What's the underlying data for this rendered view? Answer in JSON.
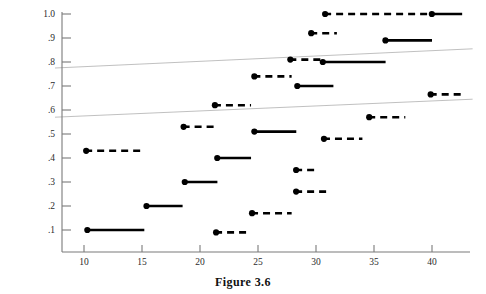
{
  "figure": {
    "caption": "Figure 3.6"
  },
  "chart_data": {
    "type": "line",
    "title": "",
    "xlabel": "",
    "ylabel": "",
    "xlim": [
      7.5,
      43.5
    ],
    "ylim": [
      0.02,
      1.04
    ],
    "grid": false,
    "legend": null,
    "x_ticks": [
      10,
      15,
      20,
      25,
      30,
      35,
      40
    ],
    "x_tick_labels": [
      "10",
      "15",
      "20",
      "25",
      "30",
      "35",
      "40"
    ],
    "y_ticks": [
      0.1,
      0.2,
      0.3,
      0.4,
      0.5,
      0.6,
      0.7,
      0.8,
      0.9,
      1.0
    ],
    "y_tick_labels": [
      ".1",
      ".2",
      ".3",
      ".4",
      ".5",
      ".6",
      ".7",
      ".8",
      ".9",
      "1.0"
    ],
    "axis_color": "#7a7a7a",
    "segment_color": "#000000",
    "trend_color": "#b9b9b9",
    "segments": [
      {
        "y": 0.1,
        "x0": 10.2,
        "x1": 15.2,
        "style": "solid",
        "marker": "left-dot"
      },
      {
        "y": 0.2,
        "x0": 15.3,
        "x1": 18.5,
        "style": "solid",
        "marker": "left-dot"
      },
      {
        "y": 0.3,
        "x0": 18.6,
        "x1": 21.5,
        "style": "solid",
        "marker": "left-dot"
      },
      {
        "y": 0.4,
        "x0": 21.4,
        "x1": 24.4,
        "style": "solid",
        "marker": "left-dot"
      },
      {
        "y": 0.51,
        "x0": 24.6,
        "x1": 28.3,
        "style": "solid",
        "marker": "left-dot"
      },
      {
        "y": 0.7,
        "x0": 28.3,
        "x1": 31.5,
        "style": "solid",
        "marker": "left-dot"
      },
      {
        "y": 0.8,
        "x0": 30.5,
        "x1": 36.0,
        "style": "solid",
        "marker": "left-dot"
      },
      {
        "y": 0.89,
        "x0": 35.9,
        "x1": 40.0,
        "style": "solid",
        "marker": "left-dot"
      },
      {
        "y": 1.0,
        "x0": 39.9,
        "x1": 42.6,
        "style": "solid",
        "marker": "left-dot"
      },
      {
        "y": 0.43,
        "x0": 10.1,
        "x1": 15.1,
        "style": "dashed",
        "marker": "left-dot"
      },
      {
        "y": 0.53,
        "x0": 18.5,
        "x1": 21.6,
        "style": "dashed",
        "marker": "left-dot"
      },
      {
        "y": 0.62,
        "x0": 21.2,
        "x1": 24.4,
        "style": "dashed",
        "marker": "left-dot"
      },
      {
        "y": 0.74,
        "x0": 24.6,
        "x1": 27.9,
        "style": "dashed",
        "marker": "left-dot"
      },
      {
        "y": 0.81,
        "x0": 27.7,
        "x1": 30.4,
        "style": "dashed",
        "marker": "left-dot"
      },
      {
        "y": 0.92,
        "x0": 29.5,
        "x1": 31.8,
        "style": "dashed",
        "marker": "left-dot"
      },
      {
        "y": 1.0,
        "x0": 30.7,
        "x1": 40.0,
        "style": "dashed",
        "marker": "left-dot"
      },
      {
        "y": 0.09,
        "x0": 21.3,
        "x1": 24.4,
        "style": "dashed",
        "marker": "left-dot"
      },
      {
        "y": 0.17,
        "x0": 24.4,
        "x1": 27.9,
        "style": "dashed",
        "marker": "left-dot"
      },
      {
        "y": 0.26,
        "x0": 28.2,
        "x1": 31.0,
        "style": "dashed",
        "marker": "left-dot"
      },
      {
        "y": 0.35,
        "x0": 28.2,
        "x1": 30.0,
        "style": "dashed",
        "marker": "left-dot"
      },
      {
        "y": 0.48,
        "x0": 30.6,
        "x1": 34.0,
        "style": "dashed",
        "marker": "left-dot"
      },
      {
        "y": 0.57,
        "x0": 34.5,
        "x1": 37.7,
        "style": "dashed",
        "marker": "left-dot"
      },
      {
        "y": 0.665,
        "x0": 39.8,
        "x1": 42.8,
        "style": "dashed",
        "marker": "left-dot"
      }
    ],
    "trend_lines": [
      {
        "name": "upper-band",
        "x0": 7.5,
        "y0": 0.775,
        "x1": 43.5,
        "y1": 0.855
      },
      {
        "name": "lower-band",
        "x0": 7.5,
        "y0": 0.57,
        "x1": 43.5,
        "y1": 0.645
      }
    ]
  }
}
